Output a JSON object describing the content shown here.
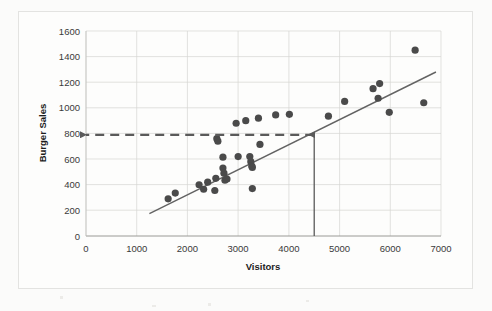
{
  "chart_data": {
    "type": "scatter",
    "title": "",
    "xlabel": "Visitors",
    "ylabel": "Burger Sales",
    "xlim": [
      0,
      7000
    ],
    "ylim": [
      0,
      1600
    ],
    "xticks": [
      0,
      1000,
      2000,
      3000,
      4000,
      5000,
      6000,
      7000
    ],
    "yticks": [
      0,
      200,
      400,
      600,
      800,
      1000,
      1200,
      1400,
      1600
    ],
    "xtick_labels": [
      "0",
      "1000",
      "2000",
      "3000",
      "4000",
      "5000",
      "6000",
      "7000"
    ],
    "ytick_labels": [
      "0",
      "200",
      "400",
      "600",
      "800",
      "1000",
      "1200",
      "1400",
      "1600"
    ],
    "grid": true,
    "legend": false,
    "marker_color": "#4a4a4a",
    "trendline_color": "#636363",
    "annotation_color": "#5a5a5a",
    "points": [
      {
        "x": 1620,
        "y": 290
      },
      {
        "x": 1760,
        "y": 335
      },
      {
        "x": 2230,
        "y": 400
      },
      {
        "x": 2320,
        "y": 365
      },
      {
        "x": 2400,
        "y": 420
      },
      {
        "x": 2540,
        "y": 355
      },
      {
        "x": 2560,
        "y": 450
      },
      {
        "x": 2580,
        "y": 760
      },
      {
        "x": 2600,
        "y": 740
      },
      {
        "x": 2700,
        "y": 615
      },
      {
        "x": 2700,
        "y": 530
      },
      {
        "x": 2720,
        "y": 490
      },
      {
        "x": 2740,
        "y": 435
      },
      {
        "x": 2780,
        "y": 445
      },
      {
        "x": 2960,
        "y": 880
      },
      {
        "x": 3000,
        "y": 620
      },
      {
        "x": 3150,
        "y": 900
      },
      {
        "x": 3230,
        "y": 620
      },
      {
        "x": 3250,
        "y": 580
      },
      {
        "x": 3270,
        "y": 545
      },
      {
        "x": 3280,
        "y": 535
      },
      {
        "x": 3280,
        "y": 370
      },
      {
        "x": 3400,
        "y": 920
      },
      {
        "x": 3430,
        "y": 715
      },
      {
        "x": 3740,
        "y": 945
      },
      {
        "x": 4010,
        "y": 950
      },
      {
        "x": 4780,
        "y": 935
      },
      {
        "x": 5100,
        "y": 1050
      },
      {
        "x": 5660,
        "y": 1150
      },
      {
        "x": 5790,
        "y": 1190
      },
      {
        "x": 5760,
        "y": 1075
      },
      {
        "x": 5980,
        "y": 965
      },
      {
        "x": 6490,
        "y": 1450
      },
      {
        "x": 6660,
        "y": 1040
      }
    ],
    "trendline": {
      "x_start": 1250,
      "y_start": 175,
      "x_end": 6900,
      "y_end": 1280
    },
    "annotations": [
      {
        "name": "vertical-arrow",
        "kind": "arrow",
        "direction": "up",
        "x": 4500,
        "y_from": 0,
        "y_to": 790,
        "style": "solid"
      },
      {
        "name": "horizontal-dashed-arrow",
        "kind": "arrow",
        "direction": "left",
        "y": 790,
        "x_from": 4500,
        "x_to": 0,
        "style": "dashed"
      }
    ]
  }
}
